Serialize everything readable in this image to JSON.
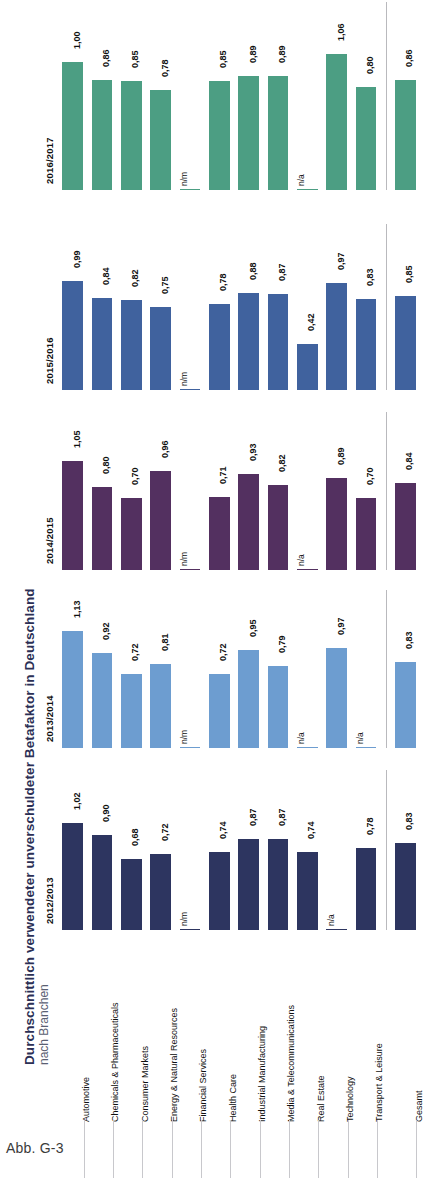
{
  "figure": {
    "title": "Durchschnittlich verwendeter unverschuldeter Betafaktor in Deutschland",
    "subtitle": "nach Branchen",
    "caption": "Abb. G-3"
  },
  "chart_data": {
    "type": "bar",
    "title": "Durchschnittlich verwendeter unverschuldeter Betafaktor in Deutschland",
    "subtitle": "nach Branchen",
    "xlabel": "",
    "ylabel": "",
    "ylim": [
      0,
      1.2
    ],
    "grid": false,
    "legend": "none",
    "orientation": "rotated-vertical-bands",
    "decimal_separator": ",",
    "missing_markers": [
      "n/m",
      "n/a"
    ],
    "categories": [
      "Automotive",
      "Chemicals & Pharmaceuticals",
      "Consumer Markets",
      "Energy & Natural Resources",
      "Financial Services",
      "Health Care",
      "Industrial Manufacturing",
      "Media & Telecommunications",
      "Real Estate",
      "Technology",
      "Transport & Leisure",
      "Gesamt"
    ],
    "series": [
      {
        "name": "2016/2017",
        "color": "#4c9e83",
        "values": [
          1.0,
          0.86,
          0.85,
          0.78,
          null,
          0.85,
          0.89,
          0.89,
          null,
          1.06,
          0.8,
          0.86
        ],
        "labels": [
          "1,00",
          "0,86",
          "0,85",
          "0,78",
          "n/m",
          "0,85",
          "0,89",
          "0,89",
          "n/a",
          "1,06",
          "0,80",
          "0,86"
        ]
      },
      {
        "name": "2015/2016",
        "color": "#40629e",
        "values": [
          0.99,
          0.84,
          0.82,
          0.75,
          null,
          0.78,
          0.88,
          0.87,
          0.42,
          0.97,
          0.83,
          0.85
        ],
        "labels": [
          "0,99",
          "0,84",
          "0,82",
          "0,75",
          "n/m",
          "0,78",
          "0,88",
          "0,87",
          "0,42",
          "0,97",
          "0,83",
          "0,85"
        ]
      },
      {
        "name": "2014/2015",
        "color": "#533060",
        "values": [
          1.05,
          0.8,
          0.7,
          0.96,
          null,
          0.71,
          0.93,
          0.82,
          null,
          0.89,
          0.7,
          0.84
        ],
        "labels": [
          "1,05",
          "0,80",
          "0,70",
          "0,96",
          "n/m",
          "0,71",
          "0,93",
          "0,82",
          "n/a",
          "0,89",
          "0,70",
          "0,84"
        ]
      },
      {
        "name": "2013/2014",
        "color": "#6d9dd0",
        "values": [
          1.13,
          0.92,
          0.72,
          0.81,
          null,
          0.72,
          0.95,
          0.79,
          null,
          0.97,
          null,
          0.83
        ],
        "labels": [
          "1,13",
          "0,92",
          "0,72",
          "0,81",
          "n/m",
          "0,72",
          "0,95",
          "0,79",
          "n/a",
          "0,97",
          "n/a",
          "0,83"
        ]
      },
      {
        "name": "2012/2013",
        "color": "#2d3560",
        "values": [
          1.02,
          0.9,
          0.68,
          0.72,
          null,
          0.74,
          0.87,
          0.87,
          0.74,
          null,
          0.78,
          0.83
        ],
        "labels": [
          "1,02",
          "0,90",
          "0,68",
          "0,72",
          "n/m",
          "0,74",
          "0,87",
          "0,87",
          "0,74",
          "n/a",
          "0,78",
          "0,83"
        ]
      }
    ]
  }
}
